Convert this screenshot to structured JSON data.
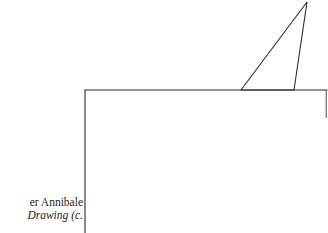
{
  "page": {
    "background_color": "#ffffff",
    "width": 328,
    "height": 233
  },
  "figure": {
    "name": "line-drawing-rectangle-with-triangle",
    "stroke_color": "#2b2b2b",
    "stroke_width": 1,
    "fill": "none",
    "shapes": [
      {
        "id": "rectangle-outline",
        "type": "polyline",
        "description": "open rectangle: left vertical edge and top horizontal edge running off the bottom of the page",
        "points": "85,233 85,90 327,90"
      },
      {
        "id": "right-edge-stub",
        "type": "line",
        "description": "short faint vertical stub at right end of horizontal rule",
        "points": "326,90 326,118"
      },
      {
        "id": "triangle",
        "type": "polygon",
        "description": "narrow triangle resting on the horizontal rule, apex clipped at the top page edge",
        "points": "241,90 307,2 294,90"
      }
    ]
  },
  "caption": {
    "lines": [
      {
        "text": "er Annibale",
        "style": "roman"
      },
      {
        "text": "Drawing (c.",
        "style": "italic"
      }
    ],
    "text_color": "#1d1d1d",
    "clipped": "left edge of caption runs off the page"
  }
}
